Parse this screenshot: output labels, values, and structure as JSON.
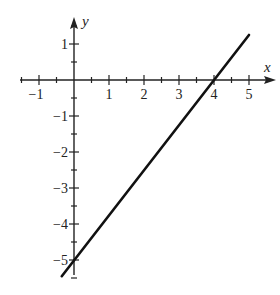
{
  "chart_data": {
    "type": "line",
    "title": "",
    "xlabel": "x",
    "ylabel": "y",
    "xlim": [
      -1.5,
      5.7
    ],
    "ylim": [
      -5.5,
      1.8
    ],
    "x_ticks": [
      -1,
      1,
      2,
      3,
      4,
      5
    ],
    "y_ticks": [
      1,
      -1,
      -2,
      -3,
      -4,
      -5
    ],
    "minor_tick_step": 0.5,
    "grid": false,
    "series": [
      {
        "name": "line",
        "equation": "y = 1.25x - 5",
        "points": [
          [
            -0.35,
            -5.45
          ],
          [
            5.0,
            1.25
          ]
        ],
        "x_intercept": 4,
        "y_intercept": -5,
        "color": "#111111"
      }
    ]
  },
  "labels": {
    "x_axis": "x",
    "y_axis": "y"
  }
}
